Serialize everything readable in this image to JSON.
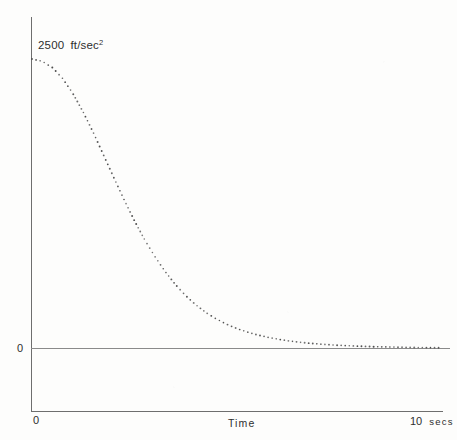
{
  "figure": {
    "background_color": "#fdfdfc",
    "ink_color": "#2e2e2e",
    "axis_color": "#6e6e6e",
    "curve_color": "#4a4a4a",
    "curve_style": "dotted"
  },
  "labels": {
    "peak_value": "2500",
    "peak_unit": "ft/sec",
    "peak_unit_exponent": "2",
    "y_zero": "0",
    "x_zero": "0",
    "x_axis_title": "Time",
    "x_end_value": "10",
    "x_end_unit": "secs"
  },
  "chart_data": {
    "type": "line",
    "title": "",
    "subtitle": "",
    "xlabel": "Time",
    "ylabel": "",
    "annotations": [
      {
        "text": "2500 ft/sec^2",
        "x": 0,
        "y": 2500,
        "note": "peak acceleration at t=0"
      },
      {
        "text": "0",
        "x": null,
        "y": 0,
        "note": "y-axis zero reference"
      },
      {
        "text": "0",
        "x": 0,
        "y": null,
        "note": "x-axis origin"
      },
      {
        "text": "10 secs",
        "x": 10,
        "y": null,
        "note": "x-axis end"
      }
    ],
    "xlim": [
      0,
      10
    ],
    "ylim": [
      0,
      2750
    ],
    "xticks": [
      0,
      10
    ],
    "xticklabels": [
      "0",
      "10 secs"
    ],
    "yticks": [
      0,
      2500
    ],
    "yticklabels": [
      "0",
      "2500 ft/sec²"
    ],
    "grid": false,
    "legend": false,
    "series": [
      {
        "name": "Acceleration",
        "units": "ft/sec^2",
        "marker": "dot",
        "linestyle": "dotted",
        "x": [
          0.0,
          0.25,
          0.5,
          0.75,
          1.0,
          1.25,
          1.5,
          1.75,
          2.0,
          2.25,
          2.5,
          2.75,
          3.0,
          3.25,
          3.5,
          3.75,
          4.0,
          4.25,
          4.5,
          4.75,
          5.0,
          5.25,
          5.5,
          5.75,
          6.0,
          6.25,
          6.5,
          6.75,
          7.0,
          7.5,
          8.0,
          8.5,
          9.0,
          9.5,
          10.0
        ],
        "y": [
          2500,
          2480,
          2425,
          2330,
          2200,
          2040,
          1860,
          1665,
          1470,
          1280,
          1100,
          935,
          790,
          660,
          548,
          452,
          372,
          305,
          250,
          205,
          168,
          138,
          113,
          93,
          76,
          62,
          51,
          42,
          34,
          23,
          15,
          10,
          7,
          4,
          2
        ]
      }
    ]
  },
  "geometry": {
    "y_axis_x": 31,
    "y_axis_top": 17,
    "y_axis_bottom": 411,
    "zero_line_y": 348,
    "zero_line_x_end": 450,
    "x_axis_y": 411,
    "x_axis_x_end": 443,
    "curve_start_y": 59
  }
}
